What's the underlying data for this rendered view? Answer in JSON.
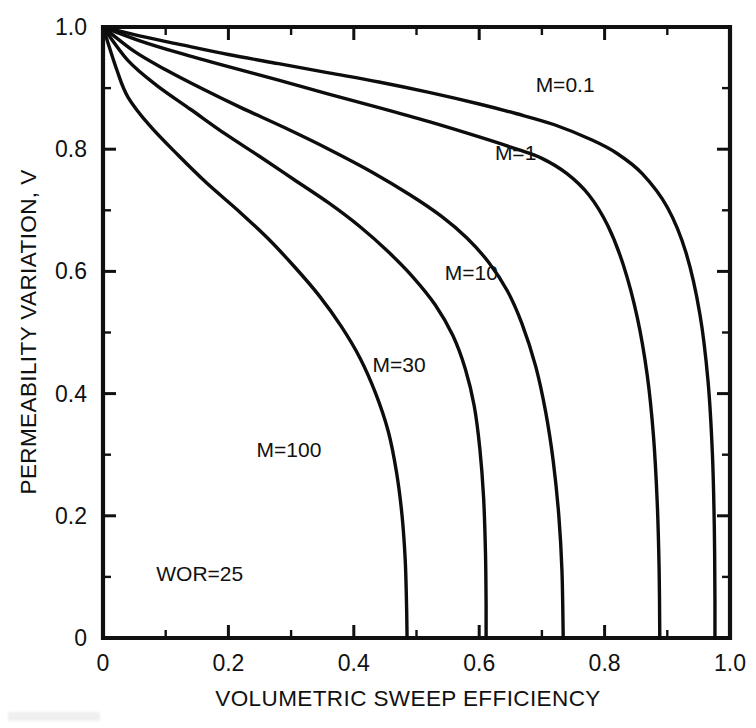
{
  "figure": {
    "background_color": "#ffffff",
    "line_color": "#0d0d0d"
  },
  "chart_data": {
    "type": "line",
    "title": "",
    "subtitle": "",
    "xlabel": "VOLUMETRIC SWEEP EFFICIENCY",
    "ylabel": "PERMEABILITY VARIATION, V",
    "xlim": [
      0,
      1.0
    ],
    "ylim": [
      0,
      1.0
    ],
    "grid": false,
    "legend": "inline-curve-labels",
    "xticks": [
      0,
      0.2,
      0.4,
      0.6,
      0.8,
      1.0
    ],
    "xtick_labels": [
      "0",
      "0.2",
      "0.4",
      "0.6",
      "0.8",
      "1.0"
    ],
    "xminor_ticks": [
      0.1,
      0.3,
      0.5,
      0.7,
      0.9
    ],
    "yticks": [
      0,
      0.2,
      0.4,
      0.6,
      0.8,
      1.0
    ],
    "ytick_labels": [
      "0",
      "0.2",
      "0.4",
      "0.6",
      "0.8",
      "1.0"
    ],
    "yminor_ticks": [
      0.1,
      0.3,
      0.5,
      0.7,
      0.9
    ],
    "annotations": [
      {
        "text": "WOR=25",
        "x": 0.085,
        "y": 0.105
      }
    ],
    "series": [
      {
        "name": "M=0.1",
        "label": "M=0.1",
        "label_x": 0.69,
        "label_y": 0.905,
        "points": [
          [
            0.0,
            1.0
          ],
          [
            0.06,
            0.985
          ],
          [
            0.12,
            0.972
          ],
          [
            0.2,
            0.955
          ],
          [
            0.28,
            0.94
          ],
          [
            0.36,
            0.925
          ],
          [
            0.44,
            0.91
          ],
          [
            0.52,
            0.893
          ],
          [
            0.6,
            0.874
          ],
          [
            0.66,
            0.858
          ],
          [
            0.72,
            0.84
          ],
          [
            0.78,
            0.815
          ],
          [
            0.82,
            0.793
          ],
          [
            0.86,
            0.76
          ],
          [
            0.9,
            0.705
          ],
          [
            0.93,
            0.63
          ],
          [
            0.952,
            0.53
          ],
          [
            0.965,
            0.42
          ],
          [
            0.972,
            0.3
          ],
          [
            0.975,
            0.18
          ],
          [
            0.976,
            0.06
          ],
          [
            0.976,
            0.0
          ]
        ]
      },
      {
        "name": "M=1",
        "label": "M=1",
        "label_x": 0.625,
        "label_y": 0.793,
        "points": [
          [
            0.0,
            1.0
          ],
          [
            0.06,
            0.977
          ],
          [
            0.12,
            0.958
          ],
          [
            0.2,
            0.935
          ],
          [
            0.28,
            0.913
          ],
          [
            0.36,
            0.89
          ],
          [
            0.44,
            0.868
          ],
          [
            0.52,
            0.845
          ],
          [
            0.6,
            0.82
          ],
          [
            0.66,
            0.8
          ],
          [
            0.7,
            0.785
          ],
          [
            0.74,
            0.76
          ],
          [
            0.775,
            0.725
          ],
          [
            0.805,
            0.675
          ],
          [
            0.83,
            0.61
          ],
          [
            0.852,
            0.525
          ],
          [
            0.868,
            0.43
          ],
          [
            0.878,
            0.33
          ],
          [
            0.884,
            0.22
          ],
          [
            0.887,
            0.11
          ],
          [
            0.888,
            0.0
          ]
        ]
      },
      {
        "name": "M=10",
        "label": "M=10",
        "label_x": 0.545,
        "label_y": 0.598,
        "points": [
          [
            0.0,
            1.0
          ],
          [
            0.05,
            0.96
          ],
          [
            0.1,
            0.93
          ],
          [
            0.16,
            0.898
          ],
          [
            0.22,
            0.868
          ],
          [
            0.29,
            0.835
          ],
          [
            0.36,
            0.8
          ],
          [
            0.43,
            0.762
          ],
          [
            0.49,
            0.725
          ],
          [
            0.54,
            0.69
          ],
          [
            0.58,
            0.655
          ],
          [
            0.615,
            0.615
          ],
          [
            0.645,
            0.568
          ],
          [
            0.668,
            0.515
          ],
          [
            0.69,
            0.445
          ],
          [
            0.706,
            0.37
          ],
          [
            0.718,
            0.29
          ],
          [
            0.727,
            0.2
          ],
          [
            0.732,
            0.11
          ],
          [
            0.734,
            0.0
          ]
        ]
      },
      {
        "name": "M=30",
        "label": "M=30",
        "label_x": 0.43,
        "label_y": 0.447,
        "points": [
          [
            0.0,
            1.0
          ],
          [
            0.04,
            0.945
          ],
          [
            0.085,
            0.905
          ],
          [
            0.14,
            0.865
          ],
          [
            0.195,
            0.825
          ],
          [
            0.25,
            0.788
          ],
          [
            0.305,
            0.75
          ],
          [
            0.36,
            0.712
          ],
          [
            0.41,
            0.673
          ],
          [
            0.455,
            0.632
          ],
          [
            0.495,
            0.59
          ],
          [
            0.53,
            0.545
          ],
          [
            0.558,
            0.495
          ],
          [
            0.578,
            0.44
          ],
          [
            0.592,
            0.38
          ],
          [
            0.601,
            0.31
          ],
          [
            0.607,
            0.23
          ],
          [
            0.61,
            0.14
          ],
          [
            0.611,
            0.055
          ],
          [
            0.611,
            0.0
          ]
        ]
      },
      {
        "name": "M=100",
        "label": "M=100",
        "label_x": 0.245,
        "label_y": 0.308,
        "points": [
          [
            0.0,
            1.0
          ],
          [
            0.022,
            0.93
          ],
          [
            0.04,
            0.885
          ],
          [
            0.075,
            0.838
          ],
          [
            0.12,
            0.79
          ],
          [
            0.165,
            0.745
          ],
          [
            0.215,
            0.7
          ],
          [
            0.262,
            0.655
          ],
          [
            0.305,
            0.608
          ],
          [
            0.345,
            0.56
          ],
          [
            0.38,
            0.51
          ],
          [
            0.41,
            0.458
          ],
          [
            0.435,
            0.4
          ],
          [
            0.455,
            0.338
          ],
          [
            0.468,
            0.272
          ],
          [
            0.477,
            0.2
          ],
          [
            0.482,
            0.128
          ],
          [
            0.484,
            0.06
          ],
          [
            0.485,
            0.0
          ]
        ]
      }
    ]
  }
}
